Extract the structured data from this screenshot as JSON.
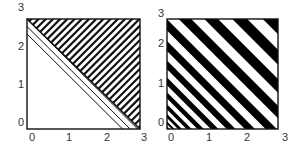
{
  "figure": {
    "panels": [
      {
        "id": "left",
        "description": "Square region divided by diagonal x+y=3; lower-left triangle hatched with thin lines parallel to the diagonal, upper-right triangle hatched with thicker lines perpendicular to it",
        "x_ticks": [
          "0",
          "1",
          "2",
          "3"
        ],
        "y_ticks": [
          "0",
          "1",
          "2",
          "3"
        ],
        "lower_region": {
          "hatch": "backslash",
          "line_weight": "thin"
        },
        "upper_region": {
          "hatch": "slash",
          "line_weight": "thick"
        }
      },
      {
        "id": "right",
        "description": "Square filled with black and white stripes along lines of constant x+y; stripes are narrow near the origin and widen toward the upper-right corner",
        "x_ticks": [
          "0",
          "1",
          "2",
          "3"
        ],
        "y_ticks": [
          "0",
          "1",
          "2",
          "3"
        ],
        "stripe_colors": [
          "#000000",
          "#ffffff"
        ]
      }
    ],
    "colors": {
      "ink": "#111111",
      "label": "#333333",
      "background": "#ffffff"
    }
  }
}
